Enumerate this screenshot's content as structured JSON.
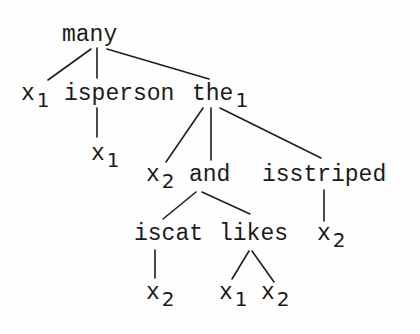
{
  "tree": {
    "root": {
      "label": "many",
      "sub": ""
    },
    "level1": [
      {
        "label": "x",
        "sub": "1"
      },
      {
        "label": "isperson",
        "sub": ""
      },
      {
        "label": "the",
        "sub": "1"
      }
    ],
    "isperson_child": {
      "label": "x",
      "sub": "1"
    },
    "the_children": [
      {
        "label": "x",
        "sub": "2"
      },
      {
        "label": "and",
        "sub": ""
      },
      {
        "label": "isstriped",
        "sub": ""
      }
    ],
    "and_children": [
      {
        "label": "iscat",
        "sub": ""
      },
      {
        "label": "likes",
        "sub": ""
      }
    ],
    "isstriped_child": {
      "label": "x",
      "sub": "2"
    },
    "iscat_child": {
      "label": "x",
      "sub": "2"
    },
    "likes_children": [
      {
        "label": "x",
        "sub": "1"
      },
      {
        "label": "x",
        "sub": "2"
      }
    ]
  }
}
